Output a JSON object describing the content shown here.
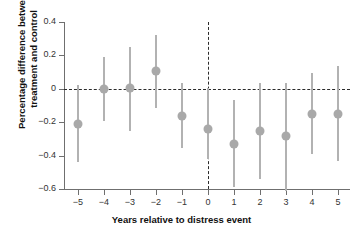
{
  "chart_data": {
    "type": "scatter",
    "title": "Percentage difference between treatment and control by event year",
    "title_clipped": true,
    "xlabel": "Years relative to distress event",
    "ylabel": "Percentage difference between treatment and control",
    "ylabel_lines": [
      "Percentage difference between",
      "treatment and control"
    ],
    "x": [
      -5,
      -4,
      -3,
      -2,
      -1,
      0,
      1,
      2,
      3,
      4,
      5
    ],
    "xtick_labels": [
      "−5",
      "−4",
      "−3",
      "−2",
      "−1",
      "0",
      "1",
      "2",
      "3",
      "4",
      "5"
    ],
    "values": [
      -0.21,
      0.0,
      0.005,
      0.105,
      -0.165,
      -0.24,
      -0.33,
      -0.255,
      -0.285,
      -0.15,
      -0.15
    ],
    "ci_low": [
      -0.44,
      -0.19,
      -0.25,
      -0.115,
      -0.355,
      -0.42,
      -0.59,
      -0.54,
      -0.61,
      -0.39,
      -0.43
    ],
    "ci_high": [
      0.02,
      0.19,
      0.25,
      0.325,
      0.035,
      0.005,
      -0.07,
      0.035,
      0.035,
      0.095,
      0.135
    ],
    "yticks": [
      0.4,
      0.2,
      0,
      -0.2,
      -0.4,
      -0.6
    ],
    "ytick_labels": [
      "0.4",
      "0.2",
      "0",
      "−0.2",
      "−0.4",
      "−0.6"
    ],
    "ylim": [
      -0.65,
      0.42
    ],
    "xlim": [
      -5.6,
      5.6
    ],
    "grid": false,
    "legend": null,
    "reference_lines": {
      "horizontal_zero": 0,
      "vertical_event": 0,
      "style": "dashed"
    },
    "colors": {
      "marker": "#a9a9a9",
      "errorbar": "#b2b2b2",
      "axis": "#6f6f6f",
      "reference_line": "#2b2b2b",
      "text": "#111111",
      "background": "#ffffff"
    }
  }
}
